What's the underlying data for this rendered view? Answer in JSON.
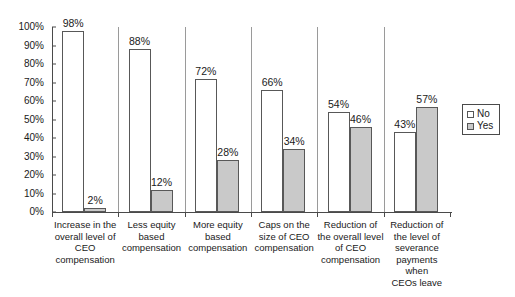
{
  "chart_data": {
    "type": "bar",
    "title": "",
    "subtitle": "",
    "xlabel": "",
    "ylabel": "",
    "ylim": [
      0,
      100
    ],
    "grid": false,
    "legend_position": "right",
    "value_suffix": "%",
    "categories": [
      "Increase in the overall level of CEO compensation",
      "Less equity based compensation",
      "More equity based compensation",
      "Caps on the size of CEO compensation",
      "Reduction of the overall level of CEO compensation",
      "Reduction of the level of severance payments when CEOs leave"
    ],
    "category_lines": [
      [
        "Increase in the",
        "overall level of",
        "CEO",
        "compensation"
      ],
      [
        "Less equity",
        "based",
        "compensation"
      ],
      [
        "More equity",
        "based",
        "compensation"
      ],
      [
        "Caps on the",
        "size of CEO",
        "compensation"
      ],
      [
        "Reduction of",
        "the overall level",
        "of CEO",
        "compensation"
      ],
      [
        "Reduction of",
        "the level of",
        "severance",
        "payments when",
        "CEOs leave"
      ]
    ],
    "series": [
      {
        "name": "No",
        "color": "#ffffff",
        "values": [
          98,
          88,
          72,
          66,
          54,
          43
        ],
        "labels": [
          "98%",
          "88%",
          "72%",
          "66%",
          "54%",
          "43%"
        ]
      },
      {
        "name": "Yes",
        "color": "#c9c9c9",
        "values": [
          2,
          12,
          28,
          34,
          46,
          57
        ],
        "labels": [
          "2%",
          "12%",
          "28%",
          "34%",
          "46%",
          "57%"
        ]
      }
    ],
    "yticks": [
      0,
      10,
      20,
      30,
      40,
      50,
      60,
      70,
      80,
      90,
      100
    ],
    "ytick_labels": [
      "0%",
      "10%",
      "20%",
      "30%",
      "40%",
      "50%",
      "60%",
      "70%",
      "80%",
      "90%",
      "100%"
    ]
  },
  "legend": {
    "items": [
      {
        "label": "No",
        "swatch": "no"
      },
      {
        "label": "Yes",
        "swatch": "yes"
      }
    ]
  }
}
